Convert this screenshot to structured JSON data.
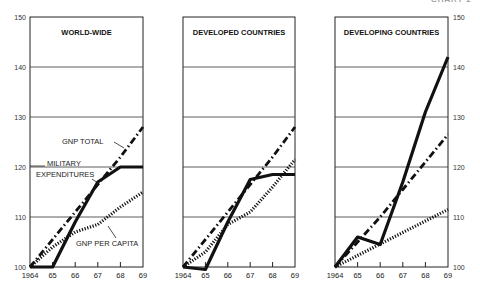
{
  "corner_label": "CHART 2",
  "chart_data": [
    {
      "type": "line",
      "title": "WORLD-WIDE",
      "x": [
        "1964",
        "65",
        "66",
        "67",
        "68",
        "69"
      ],
      "ylim": [
        100,
        150
      ],
      "yticks": [
        "100",
        "110",
        "120",
        "130",
        "140",
        "150"
      ],
      "y_axis_side": "left",
      "grid": true,
      "series": [
        {
          "name": "GNP TOTAL",
          "style": "dash-dot",
          "values": [
            100,
            105.5,
            111,
            116.5,
            122,
            128
          ]
        },
        {
          "name": "MILITARY EXPENDITURES",
          "style": "solid",
          "values": [
            100,
            100,
            109,
            117,
            120,
            120
          ]
        },
        {
          "name": "GNP PER CAPITA",
          "style": "dotted",
          "values": [
            100,
            104,
            107,
            108.5,
            112,
            115
          ]
        }
      ],
      "annotations": [
        "GNP TOTAL",
        "MILITARY",
        "EXPENDITURES",
        "GNP PER CAPITA"
      ]
    },
    {
      "type": "line",
      "title": "DEVELOPED COUNTRIES",
      "x": [
        "1964",
        "65",
        "66",
        "67",
        "68",
        "69"
      ],
      "ylim": [
        100,
        150
      ],
      "grid": true,
      "series": [
        {
          "name": "GNP TOTAL",
          "style": "dash-dot",
          "values": [
            100,
            105.5,
            111,
            116.5,
            122,
            128
          ]
        },
        {
          "name": "MILITARY EXPENDITURES",
          "style": "solid",
          "values": [
            100,
            99.5,
            109,
            117.5,
            118.5,
            118.5
          ]
        },
        {
          "name": "GNP PER CAPITA",
          "style": "dotted",
          "values": [
            100,
            103,
            108.5,
            111,
            116,
            121.5
          ]
        }
      ]
    },
    {
      "type": "line",
      "title": "DEVELOPING COUNTRIES",
      "x": [
        "1964",
        "65",
        "66",
        "67",
        "68",
        "69"
      ],
      "ylim": [
        100,
        150
      ],
      "yticks": [
        "100",
        "110",
        "120",
        "130",
        "140",
        "150"
      ],
      "y_axis_side": "right",
      "grid": true,
      "series": [
        {
          "name": "GNP TOTAL",
          "style": "dash-dot",
          "values": [
            100,
            105,
            110,
            115.5,
            121,
            126.5
          ]
        },
        {
          "name": "MILITARY EXPENDITURES",
          "style": "solid",
          "values": [
            100,
            106,
            104.5,
            117,
            131,
            142
          ]
        },
        {
          "name": "GNP PER CAPITA",
          "style": "dotted",
          "values": [
            100,
            102.3,
            104.6,
            106.9,
            109.2,
            111.5
          ]
        }
      ]
    }
  ]
}
